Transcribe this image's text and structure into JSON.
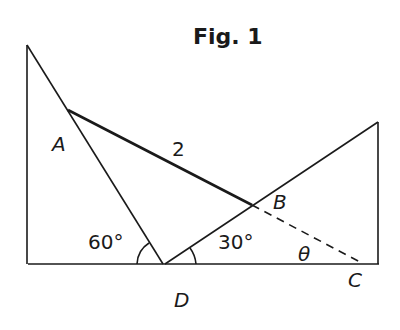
{
  "figure": {
    "title": "Fig. 1",
    "points": {
      "A": "A",
      "B": "B",
      "C": "C",
      "D": "D"
    },
    "length_AB": "2",
    "angle_left": "60°",
    "angle_right": "30°",
    "angle_theta": "θ"
  },
  "colors": {
    "ink": "#1a1a1a",
    "background": "#ffffff"
  }
}
